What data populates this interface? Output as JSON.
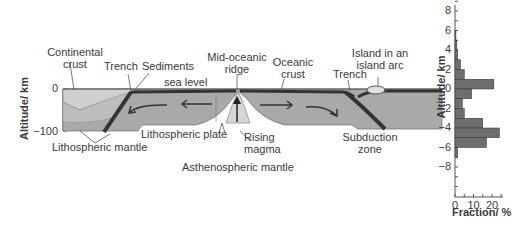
{
  "cross_section": {
    "y_axis_title": "Altitude/ km",
    "y_ticks": [
      "0",
      "−100"
    ],
    "labels": {
      "continental_crust": [
        "Continental",
        "crust"
      ],
      "trench_left": "Trench",
      "sediments": "Sediments",
      "sea_level": "sea level",
      "mid_oceanic_ridge": [
        "Mid-oceanic",
        "ridge"
      ],
      "oceanic_crust": [
        "Oceanic",
        "crust"
      ],
      "trench_right": "Trench",
      "island_arc": [
        "Island in an",
        "island arc"
      ],
      "lithospheric_plate": "Lithospheric plate",
      "lithospheric_mantle": "Lithospheric mantle",
      "rising_magma": [
        "Rising",
        "magma"
      ],
      "asthenospheric_mantle": "Asthenospheric mantle",
      "subduction_zone": [
        "Subduction",
        "zone"
      ]
    },
    "colors": {
      "continental": "#c8c8c8",
      "lithosphere": "#a9a9a9",
      "slab": "#3a3a3a",
      "background": "#ffffff"
    }
  },
  "chart_data": {
    "type": "bar",
    "orientation": "horizontal",
    "title": "",
    "xlabel": "Fraction/ %",
    "ylabel": "Altitude/ km",
    "x_ticks": [
      "0",
      "10",
      "20"
    ],
    "y_ticks": [
      "8",
      "6",
      "4",
      "2",
      "0",
      "−2",
      "−4",
      "−6",
      "−8"
    ],
    "xlim": [
      0,
      27
    ],
    "ylim": [
      -10,
      9
    ],
    "grid": false,
    "bin_width_km": 1,
    "bins_top_km": [
      6,
      5,
      4,
      3,
      2,
      1,
      0,
      -1,
      -2,
      -3,
      -4,
      -5,
      -6
    ],
    "values": [
      0.5,
      1,
      1.5,
      3,
      5,
      21,
      9,
      4,
      5,
      15,
      24,
      17,
      1.5
    ],
    "bar_color": "#6e6e6e"
  }
}
